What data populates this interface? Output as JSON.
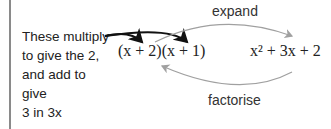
{
  "diagram": {
    "note_lines": [
      "These multiply",
      "to give the 2,",
      "and add to give",
      "3 in 3x"
    ],
    "factored": "(x + 2)(x + 1)",
    "expanded": "x² + 3x + 2",
    "top_label": "expand",
    "bottom_label": "factorise",
    "colors": {
      "dark_arrow": "#111111",
      "grey_arrow": "#a0a0a0",
      "border": "#8a8a8a"
    }
  }
}
